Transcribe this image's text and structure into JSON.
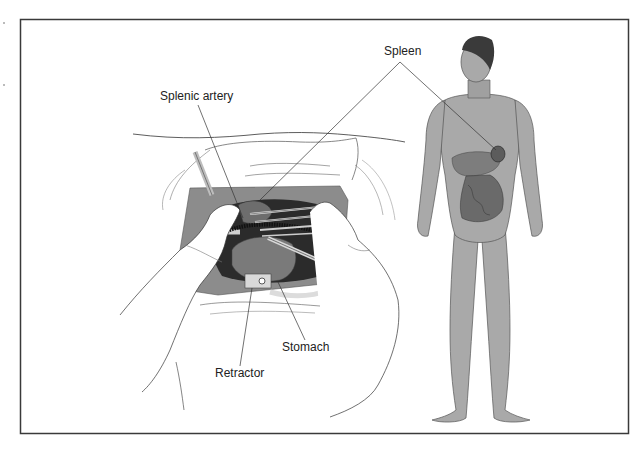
{
  "figure": {
    "labels": {
      "spleen": "Spleen",
      "splenic_artery": "Splenic artery",
      "stomach": "Stomach",
      "retractor": "Retractor"
    },
    "colors": {
      "frame": "#3a3a3a",
      "skin": "#a9a9a9",
      "skin_dark": "#8a8a8a",
      "drape": "#8c8c8c",
      "cavity": "#2b2b2b",
      "glove": "#ffffff",
      "line": "#333333"
    }
  }
}
